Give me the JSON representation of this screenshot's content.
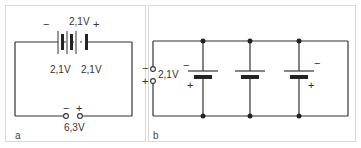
{
  "panels": [
    {
      "id": "a",
      "label": "a",
      "description": "Three cells connected in series",
      "cells": [
        {
          "voltage_label": "2,1V"
        },
        {
          "voltage_label": "2,1V"
        },
        {
          "voltage_label": "2,1V"
        }
      ],
      "top_voltage_label": "2,1V",
      "left_voltage_label": "2,1V",
      "right_voltage_label": "2,1V",
      "battery_minus": "−",
      "battery_plus": "+",
      "terminal_minus": "−",
      "terminal_plus": "+",
      "output_voltage_label": "6,3V"
    },
    {
      "id": "b",
      "label": "b",
      "description": "Three cells connected in parallel",
      "terminal_minus": "−",
      "terminal_plus": "+",
      "output_voltage_label": "2,1V",
      "cells": [
        {
          "minus": "−",
          "plus": "+"
        },
        {
          "minus": "",
          "plus": ""
        },
        {
          "minus": "−",
          "plus": "+"
        }
      ]
    }
  ],
  "colors": {
    "line": "#333333",
    "border": "#d8d8d8",
    "background": "#ffffff"
  }
}
